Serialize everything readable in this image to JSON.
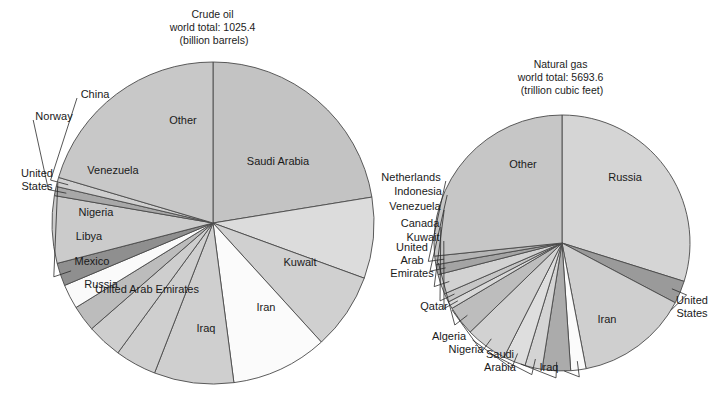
{
  "figure": {
    "background": "#ffffff",
    "width": 721,
    "height": 404
  },
  "charts": [
    {
      "id": "crude-oil",
      "title_lines": [
        "Crude oil",
        "world total: 1025.4",
        "(billion barrels)"
      ],
      "title_x": 214,
      "title_y": 18,
      "center": {
        "x": 213,
        "y": 223
      },
      "radius": 161,
      "start_angle_deg": -90,
      "direction": "clockwise"
    },
    {
      "id": "natural-gas",
      "title_lines": [
        "Natural gas",
        "world total: 5693.6",
        "(trillion cubic feet)"
      ],
      "title_x": 562,
      "title_y": 68,
      "center": {
        "x": 562,
        "y": 243
      },
      "radius": 128,
      "start_angle_deg": -90,
      "direction": "clockwise"
    }
  ],
  "chart_data": [
    {
      "type": "pie",
      "id": "crude-oil",
      "title": "Crude oil world total: 1025.4 (billion barrels)",
      "unit": "billion barrels",
      "total": 1025.4,
      "categories": [
        "Saudi Arabia",
        "Kuwait",
        "Iran",
        "Iraq",
        "United Arab Emirates",
        "Russia",
        "Mexico",
        "Libya",
        "Nigeria",
        "United States",
        "Venezuela",
        "Norway",
        "China",
        "Other"
      ],
      "values": [
        73.0,
        26.5,
        25.0,
        31.5,
        26.0,
        13.5,
        11.5,
        8.5,
        8.0,
        7.5,
        22.0,
        3.0,
        3.0,
        66.5
      ],
      "percentages": [
        20.3,
        7.4,
        6.9,
        8.7,
        7.2,
        3.8,
        3.2,
        2.4,
        2.2,
        2.1,
        6.1,
        0.8,
        0.8,
        18.4
      ],
      "legend": "none",
      "labels_position": "inside-and-outside"
    },
    {
      "type": "pie",
      "id": "natural-gas",
      "title": "Natural gas world total: 5693.6 (trillion cubic feet)",
      "unit": "trillion cubic feet",
      "total": 5693.6,
      "categories": [
        "Russia",
        "United States",
        "Iran",
        "Iraq",
        "Saudi Arabia",
        "Nigeria",
        "Algeria",
        "Qatar",
        "United Arab Emirates",
        "Kuwait",
        "Canada",
        "Venezuela",
        "Indonesia",
        "Netherlands",
        "Other"
      ],
      "values": [
        1700.0,
        164.0,
        812.0,
        110.0,
        204.0,
        124.0,
        160.0,
        300.0,
        212.0,
        52.0,
        64.0,
        143.0,
        72.0,
        62.0,
        1516.6
      ],
      "percentages": [
        29.9,
        2.9,
        14.3,
        1.9,
        3.6,
        2.2,
        2.8,
        5.3,
        3.7,
        0.9,
        1.1,
        2.5,
        1.3,
        1.1,
        26.6
      ],
      "legend": "none",
      "labels_position": "inside-and-outside"
    }
  ],
  "crude_oil_slices": [
    {
      "name": "Saudi Arabia",
      "label": "Saudi Arabia",
      "a0": -90,
      "a1": -90,
      "fill": "#c3c3c3",
      "label_x": 278,
      "label_y": 165,
      "placement": "inside"
    },
    {
      "name": "Kuwait",
      "label": "Kuwait",
      "fill": "#dcdcdc",
      "label_x": 300,
      "label_y": 266,
      "placement": "inside"
    },
    {
      "name": "Iran",
      "label": "Iran",
      "fill": "#d0d0d0",
      "label_x": 266,
      "label_y": 311,
      "placement": "inside"
    },
    {
      "name": "Iraq",
      "label": "Iraq",
      "fill": "#fbfbfb",
      "label_x": 206,
      "label_y": 332,
      "placement": "inside"
    },
    {
      "name": "United Arab Emirates",
      "label": "United Arab Emirates",
      "fill": "#cfcfcf",
      "label_x": 147,
      "label_y": 293,
      "placement": "inside"
    },
    {
      "name": "Russia",
      "label": "Russia",
      "fill": "#cfcfcf",
      "label_x": 101,
      "label_y": 288,
      "placement": "inside"
    },
    {
      "name": "Mexico",
      "label": "Mexico",
      "fill": "#cecece",
      "label_x": 92,
      "label_y": 265,
      "placement": "inside"
    },
    {
      "name": "Libya",
      "label": "Libya",
      "fill": "#bcbcbc",
      "label_x": 89,
      "label_y": 240,
      "placement": "inside"
    },
    {
      "name": "Nigeria",
      "label": "Nigeria",
      "fill": "#fafafa",
      "label_x": 96,
      "label_y": 216,
      "placement": "inside"
    },
    {
      "name": "United States",
      "label_lines": [
        "United",
        "States"
      ],
      "fill": "#8f8f8f",
      "label_x": 37,
      "label_y": 183,
      "placement": "outside"
    },
    {
      "name": "Venezuela",
      "label": "Venezuela",
      "fill": "#cbcbcb",
      "label_x": 113,
      "label_y": 174,
      "placement": "inside"
    },
    {
      "name": "Norway",
      "label": "Norway",
      "fill": "#a8a8a8",
      "label_x": 54,
      "label_y": 120,
      "placement": "outside"
    },
    {
      "name": "China",
      "label": "China",
      "fill": "#cfcfcf",
      "label_x": 95,
      "label_y": 98,
      "placement": "outside"
    },
    {
      "name": "Other",
      "label": "Other",
      "fill": "#c8c8c8",
      "label_x": 183,
      "label_y": 124,
      "placement": "inside"
    }
  ],
  "natural_gas_slices": [
    {
      "name": "Russia",
      "label": "Russia",
      "fill": "#d5d5d5",
      "label_x": 625,
      "label_y": 181,
      "placement": "inside"
    },
    {
      "name": "United States",
      "label_lines": [
        "United",
        "States"
      ],
      "fill": "#9a9a9a",
      "label_x": 692,
      "label_y": 310,
      "placement": "outside"
    },
    {
      "name": "Iran",
      "label": "Iran",
      "fill": "#cfcfcf",
      "label_x": 607,
      "label_y": 323,
      "placement": "inside"
    },
    {
      "name": "Iraq",
      "label": "Iraq",
      "fill": "#fbfbfb",
      "label_x": 549,
      "label_y": 371,
      "placement": "outside"
    },
    {
      "name": "Saudi Arabia",
      "label_lines": [
        "Saudi",
        "Arabia"
      ],
      "fill": "#ababab",
      "label_x": 500,
      "label_y": 364,
      "placement": "outside"
    },
    {
      "name": "Nigeria",
      "label": "Nigeria",
      "fill": "#d4d4d4",
      "label_x": 466,
      "label_y": 353,
      "placement": "outside"
    },
    {
      "name": "Algeria",
      "label": "Algeria",
      "fill": "#dedede",
      "label_x": 449,
      "label_y": 340,
      "placement": "outside"
    },
    {
      "name": "Qatar",
      "label": "Qatar",
      "fill": "#d2d2d2",
      "label_x": 434,
      "label_y": 310,
      "placement": "outside"
    },
    {
      "name": "United Arab Emirates",
      "label_lines": [
        "United",
        "Arab",
        "Emirates"
      ],
      "fill": "#bdbdbd",
      "label_x": 412,
      "label_y": 263,
      "placement": "outside"
    },
    {
      "name": "Kuwait",
      "label": "Kuwait",
      "fill": "#d8d8d8",
      "label_x": 423,
      "label_y": 241,
      "placement": "outside"
    },
    {
      "name": "Canada",
      "label": "Canada",
      "fill": "#c6c6c6",
      "label_x": 420,
      "label_y": 227,
      "placement": "outside"
    },
    {
      "name": "Venezuela",
      "label": "Venezuela",
      "fill": "#d2d2d2",
      "label_x": 415,
      "label_y": 210,
      "placement": "outside"
    },
    {
      "name": "Indonesia",
      "label": "Indonesia",
      "fill": "#a4a4a4",
      "label_x": 418,
      "label_y": 195,
      "placement": "outside"
    },
    {
      "name": "Netherlands",
      "label": "Netherlands",
      "fill": "#b5b5b5",
      "label_x": 411,
      "label_y": 181,
      "placement": "outside"
    },
    {
      "name": "Other",
      "label": "Other",
      "fill": "#c6c6c6",
      "label_x": 523,
      "label_y": 168,
      "placement": "inside"
    }
  ],
  "colors": {
    "outline": "#4a4a4a",
    "text": "#1a1a1a",
    "leader": "#2b2b2b",
    "background": "#ffffff"
  }
}
